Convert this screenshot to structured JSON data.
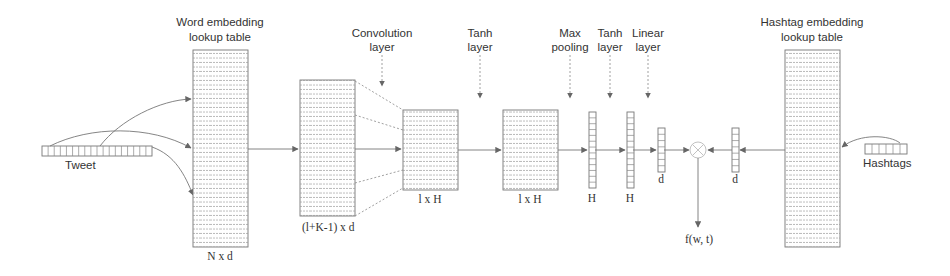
{
  "diagram": {
    "type": "neural-network-architecture",
    "title_labels": {
      "word_embedding": [
        "Word embedding",
        "lookup table"
      ],
      "convolution": [
        "Convolution",
        "layer"
      ],
      "tanh1": [
        "Tanh",
        "layer"
      ],
      "max_pooling": [
        "Max",
        "pooling"
      ],
      "tanh2": [
        "Tanh",
        "layer"
      ],
      "linear": [
        "Linear",
        "layer"
      ],
      "hashtag_embedding": [
        "Hashtag embedding",
        "lookup table"
      ]
    },
    "inputs": {
      "tweet": "Tweet",
      "hashtags": "Hashtags"
    },
    "dimensions": {
      "word_table": "N x d",
      "conv_input": "(l+K-1) x d",
      "conv_output": "l x H",
      "tanh_output": "l x H",
      "max_pool_vector": "H",
      "tanh_vector": "H",
      "linear_vector": "d",
      "hashtag_vector": "d"
    },
    "output": "f(w, t)",
    "nodes": [
      {
        "id": "tweet",
        "label": "Tweet"
      },
      {
        "id": "word_table",
        "label": "Word embedding lookup table",
        "dim": "N x d"
      },
      {
        "id": "conv_in",
        "dim": "(l+K-1) x d"
      },
      {
        "id": "conv_out",
        "label": "Convolution layer",
        "dim": "l x H"
      },
      {
        "id": "tanh_out",
        "label": "Tanh layer",
        "dim": "l x H"
      },
      {
        "id": "maxpool",
        "label": "Max pooling",
        "dim": "H"
      },
      {
        "id": "tanh2",
        "label": "Tanh layer",
        "dim": "H"
      },
      {
        "id": "linear",
        "label": "Linear layer",
        "dim": "d"
      },
      {
        "id": "product",
        "label": "⊗"
      },
      {
        "id": "hash_vec",
        "dim": "d"
      },
      {
        "id": "hash_table",
        "label": "Hashtag embedding lookup table"
      },
      {
        "id": "hashtags",
        "label": "Hashtags"
      },
      {
        "id": "output",
        "label": "f(w, t)"
      }
    ],
    "edges": [
      [
        "tweet",
        "word_table"
      ],
      [
        "word_table",
        "conv_in"
      ],
      [
        "conv_in",
        "conv_out"
      ],
      [
        "conv_out",
        "tanh_out"
      ],
      [
        "tanh_out",
        "maxpool"
      ],
      [
        "maxpool",
        "tanh2"
      ],
      [
        "tanh2",
        "linear"
      ],
      [
        "linear",
        "product"
      ],
      [
        "hash_vec",
        "product"
      ],
      [
        "hash_table",
        "hash_vec"
      ],
      [
        "hashtags",
        "hash_table"
      ],
      [
        "product",
        "output"
      ]
    ]
  }
}
